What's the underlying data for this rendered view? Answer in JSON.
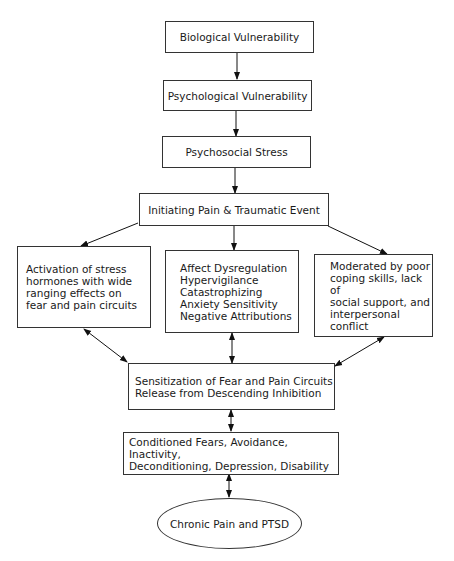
{
  "diagram": {
    "type": "flowchart",
    "nodes": [
      {
        "id": "biological",
        "label": "Biological Vulnerability"
      },
      {
        "id": "psychological",
        "label": "Psychological Vulnerability"
      },
      {
        "id": "psychosocial",
        "label": "Psychosocial Stress"
      },
      {
        "id": "initiating",
        "label": "Initiating Pain & Traumatic Event"
      },
      {
        "id": "stress_hormones",
        "label": "Activation of stress\nhormones with wide\nranging effects on\nfear and pain circuits"
      },
      {
        "id": "affect",
        "label": "Affect Dysregulation\nHypervigilance\nCatastrophizing\nAnxiety Sensitivity\nNegative Attributions"
      },
      {
        "id": "moderated",
        "label": "Moderated by poor\ncoping skills, lack of\nsocial support, and\ninterpersonal conflict"
      },
      {
        "id": "sensitization",
        "label": "Sensitization of Fear and Pain Circuits\nRelease from Descending Inhibition"
      },
      {
        "id": "conditioned",
        "label": "Conditioned Fears, Avoidance, Inactivity,\nDeconditioning, Depression, Disability"
      },
      {
        "id": "outcome",
        "label": "Chronic Pain and PTSD"
      }
    ],
    "edges": [
      {
        "from": "biological",
        "to": "psychological",
        "direction": "forward"
      },
      {
        "from": "psychological",
        "to": "psychosocial",
        "direction": "forward"
      },
      {
        "from": "psychosocial",
        "to": "initiating",
        "direction": "forward"
      },
      {
        "from": "initiating",
        "to": "stress_hormones",
        "direction": "forward"
      },
      {
        "from": "initiating",
        "to": "affect",
        "direction": "forward"
      },
      {
        "from": "initiating",
        "to": "moderated",
        "direction": "forward"
      },
      {
        "from": "stress_hormones",
        "to": "sensitization",
        "direction": "both"
      },
      {
        "from": "affect",
        "to": "sensitization",
        "direction": "both"
      },
      {
        "from": "moderated",
        "to": "sensitization",
        "direction": "both"
      },
      {
        "from": "sensitization",
        "to": "conditioned",
        "direction": "both"
      },
      {
        "from": "conditioned",
        "to": "outcome",
        "direction": "both"
      }
    ]
  }
}
